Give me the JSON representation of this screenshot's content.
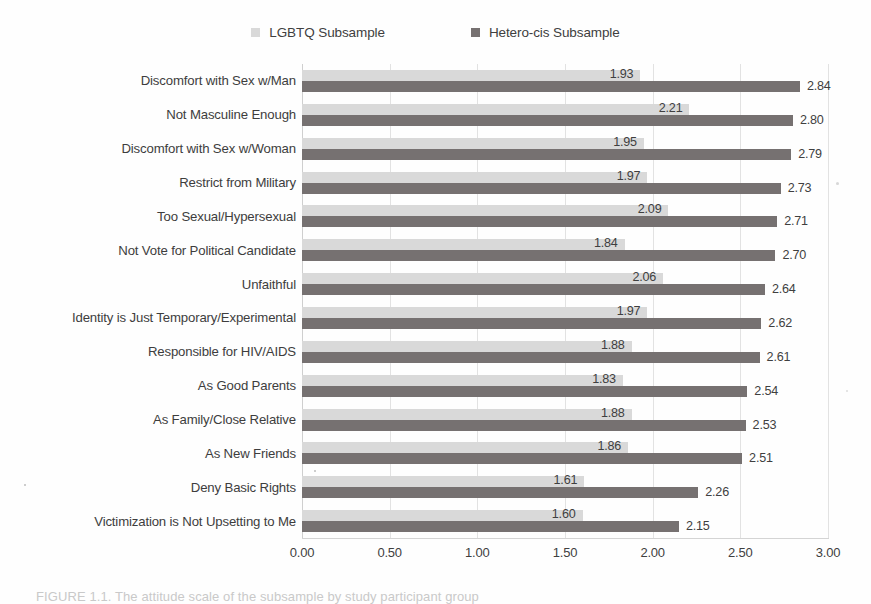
{
  "chart_data": {
    "type": "bar",
    "orientation": "horizontal",
    "title": "",
    "subtitle": "",
    "xlabel": "",
    "ylabel": "",
    "xlim": [
      0,
      3
    ],
    "xticks": [
      "0.00",
      "0.50",
      "1.00",
      "1.50",
      "2.00",
      "2.50",
      "3.00"
    ],
    "xtick_values": [
      0,
      0.5,
      1,
      1.5,
      2,
      2.5,
      3
    ],
    "grid": "vertical",
    "legend_position": "top-center",
    "categories": [
      "Discomfort with Sex w/Man",
      "Not Masculine Enough",
      "Discomfort with Sex w/Woman",
      "Restrict from Military",
      "Too Sexual/Hypersexual",
      "Not Vote for Political Candidate",
      "Unfaithful",
      "Identity is Just Temporary/Experimental",
      "Responsible for HIV/AIDS",
      "As Good Parents",
      "As Family/Close Relative",
      "As New Friends",
      "Deny Basic Rights",
      "Victimization is Not Upsetting to Me"
    ],
    "series": [
      {
        "name": "LGBTQ Subsample",
        "color": "#d9d9d9",
        "values": [
          1.93,
          2.21,
          1.95,
          1.97,
          2.09,
          1.84,
          2.06,
          1.97,
          1.88,
          1.83,
          1.88,
          1.86,
          1.61,
          1.6
        ],
        "labels": [
          "1.93",
          "2.21",
          "1.95",
          "1.97",
          "2.09",
          "1.84",
          "2.06",
          "1.97",
          "1.88",
          "1.83",
          "1.88",
          "1.86",
          "1.61",
          "1.60"
        ]
      },
      {
        "name": "Hetero-cis Subsample",
        "color": "#767171",
        "values": [
          2.84,
          2.8,
          2.79,
          2.73,
          2.71,
          2.7,
          2.64,
          2.62,
          2.61,
          2.54,
          2.53,
          2.51,
          2.26,
          2.15
        ],
        "labels": [
          "2.84",
          "2.80",
          "2.79",
          "2.73",
          "2.71",
          "2.70",
          "2.64",
          "2.62",
          "2.61",
          "2.54",
          "2.53",
          "2.51",
          "2.26",
          "2.15"
        ]
      }
    ]
  },
  "legend": {
    "entries": [
      {
        "label": "LGBTQ Subsample",
        "color": "#d9d9d9",
        "swatch_name": "legend-swatch-lgbtq"
      },
      {
        "label": "Hetero-cis Subsample",
        "color": "#767171",
        "swatch_name": "legend-swatch-hetero-cis"
      }
    ]
  },
  "caption": {
    "text": "FIGURE 1.1. The attitude scale of the subsample by study participant group"
  }
}
